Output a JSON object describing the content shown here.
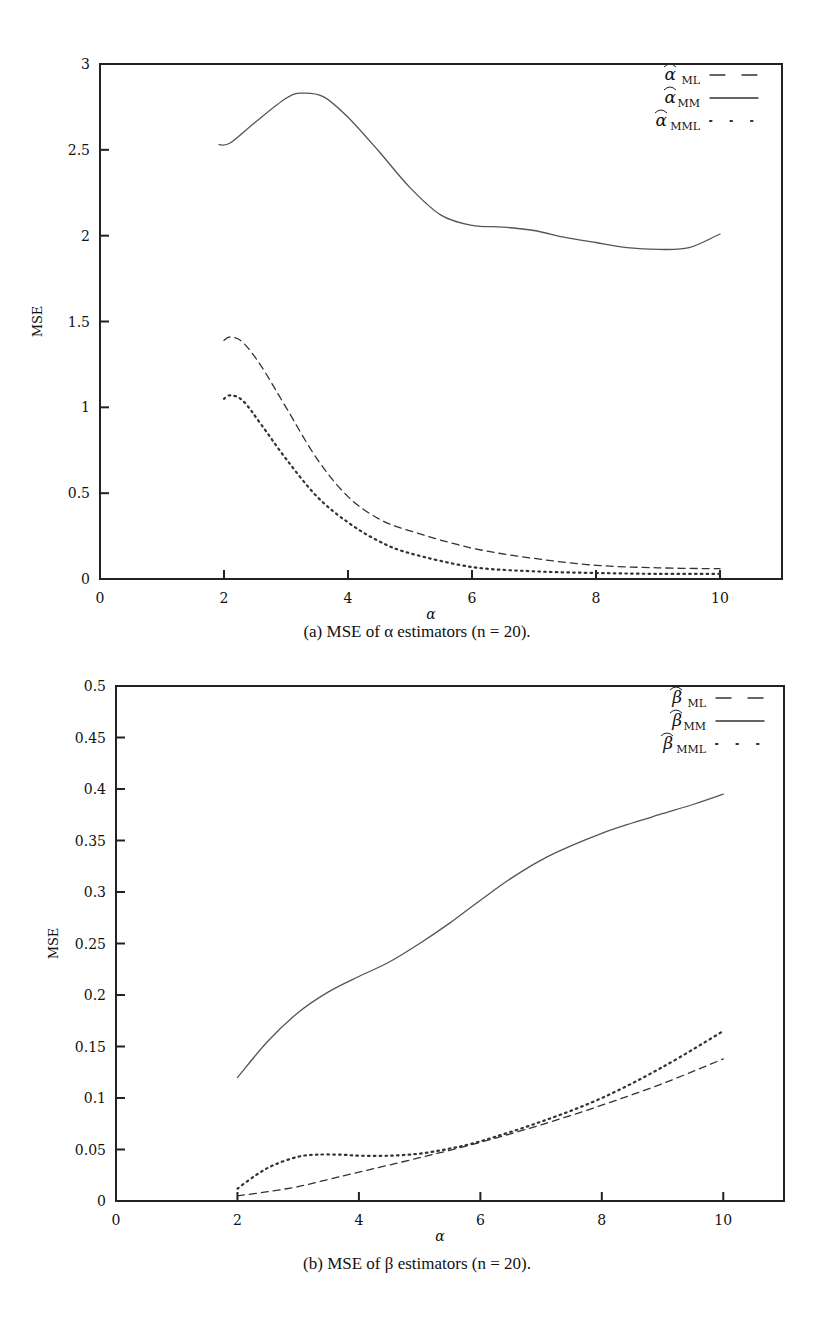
{
  "chart_data": [
    {
      "id": "a",
      "type": "line",
      "title": "",
      "caption": "(a) MSE of α estimators (n = 20).",
      "xlabel": "α",
      "ylabel": "MSE",
      "xlim": [
        0,
        11
      ],
      "ylim": [
        0,
        3
      ],
      "xticks": [
        0,
        2,
        4,
        6,
        8,
        10
      ],
      "yticks": [
        0,
        0.5,
        1,
        1.5,
        2,
        2.5,
        3
      ],
      "ytick_labels": [
        "0",
        "0.5",
        "1",
        "1.5",
        "2",
        "2.5",
        "3"
      ],
      "grid": false,
      "legend_position": "upper right",
      "series": [
        {
          "name": "α̂_ML",
          "style": "dashed",
          "x": [
            2,
            2.1,
            2.3,
            2.6,
            3.0,
            3.5,
            4.0,
            4.5,
            5.0,
            6.0,
            7.0,
            8.0,
            9.0,
            10.0
          ],
          "y": [
            1.39,
            1.41,
            1.38,
            1.24,
            1.0,
            0.7,
            0.48,
            0.35,
            0.28,
            0.18,
            0.12,
            0.08,
            0.065,
            0.06
          ]
        },
        {
          "name": "α̂_MM",
          "style": "solid",
          "x": [
            1.92,
            2.1,
            2.5,
            3.0,
            3.25,
            3.6,
            4.0,
            4.5,
            5.0,
            5.5,
            6.0,
            6.5,
            7.0,
            7.5,
            8.0,
            8.5,
            9.0,
            9.5,
            10.0
          ],
          "y": [
            2.53,
            2.54,
            2.66,
            2.8,
            2.83,
            2.81,
            2.69,
            2.49,
            2.28,
            2.12,
            2.06,
            2.05,
            2.03,
            1.99,
            1.96,
            1.93,
            1.92,
            1.93,
            2.01
          ]
        },
        {
          "name": "α̂_MML",
          "style": "dotted",
          "x": [
            2,
            2.1,
            2.3,
            2.6,
            3.0,
            3.5,
            4.0,
            4.5,
            5.0,
            6.0,
            7.0,
            8.0,
            9.0,
            10.0
          ],
          "y": [
            1.05,
            1.07,
            1.04,
            0.9,
            0.7,
            0.48,
            0.33,
            0.22,
            0.15,
            0.07,
            0.045,
            0.035,
            0.03,
            0.03
          ]
        }
      ]
    },
    {
      "id": "b",
      "type": "line",
      "title": "",
      "caption": "(b) MSE of β estimators (n = 20).",
      "xlabel": "α",
      "ylabel": "MSE",
      "xlim": [
        0,
        11
      ],
      "ylim": [
        0,
        0.5
      ],
      "xticks": [
        0,
        2,
        4,
        6,
        8,
        10
      ],
      "yticks": [
        0,
        0.05,
        0.1,
        0.15,
        0.2,
        0.25,
        0.3,
        0.35,
        0.4,
        0.45,
        0.5
      ],
      "ytick_labels": [
        "0",
        "0.05",
        "0.1",
        "0.15",
        "0.2",
        "0.25",
        "0.3",
        "0.35",
        "0.4",
        "0.45",
        "0.5"
      ],
      "grid": false,
      "legend_position": "upper right",
      "series": [
        {
          "name": "β̂_ML",
          "style": "dashed",
          "x": [
            2,
            2.5,
            3,
            3.5,
            4,
            5,
            6,
            7,
            8,
            9,
            10
          ],
          "y": [
            0.005,
            0.009,
            0.014,
            0.021,
            0.028,
            0.042,
            0.057,
            0.074,
            0.093,
            0.114,
            0.138
          ]
        },
        {
          "name": "β̂_MM",
          "style": "solid",
          "x": [
            2,
            2.5,
            3,
            3.5,
            4,
            4.5,
            5,
            5.5,
            6,
            6.5,
            7,
            7.5,
            8,
            8.5,
            9,
            9.5,
            10
          ],
          "y": [
            0.12,
            0.155,
            0.183,
            0.203,
            0.218,
            0.232,
            0.25,
            0.27,
            0.292,
            0.313,
            0.331,
            0.345,
            0.357,
            0.367,
            0.376,
            0.385,
            0.395
          ]
        },
        {
          "name": "β̂_MML",
          "style": "dotted",
          "x": [
            2,
            2.3,
            2.6,
            3.0,
            3.3,
            3.7,
            4,
            4.5,
            5,
            5.5,
            6,
            7,
            8,
            9,
            10
          ],
          "y": [
            0.012,
            0.025,
            0.035,
            0.043,
            0.045,
            0.045,
            0.044,
            0.044,
            0.046,
            0.051,
            0.058,
            0.077,
            0.1,
            0.13,
            0.165
          ]
        }
      ]
    }
  ],
  "figures": {
    "a": {
      "caption": "(a) MSE of α estimators (n = 20).",
      "xlabel": "α",
      "ylabel": "MSE",
      "legend": [
        {
          "symbol": "α",
          "sub": "ML"
        },
        {
          "symbol": "α",
          "sub": "MM"
        },
        {
          "symbol": "α",
          "sub": "MML"
        }
      ]
    },
    "b": {
      "caption": "(b) MSE of β estimators (n = 20).",
      "xlabel": "α",
      "ylabel": "MSE",
      "legend": [
        {
          "symbol": "β",
          "sub": "ML"
        },
        {
          "symbol": "β",
          "sub": "MM"
        },
        {
          "symbol": "β",
          "sub": "MML"
        }
      ]
    }
  },
  "colors": {
    "ink": "#222222",
    "curve": "#555555",
    "background": "#ffffff"
  }
}
